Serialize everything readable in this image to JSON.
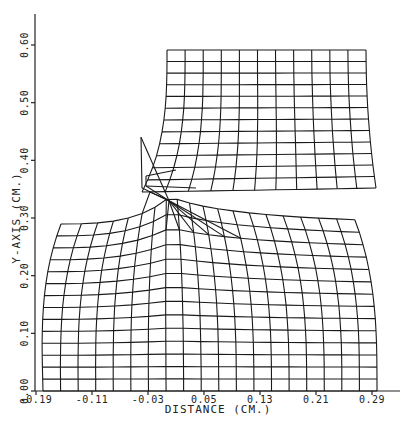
{
  "chart_data": {
    "type": "mesh",
    "title": "",
    "xlabel": "DISTANCE (CM.)",
    "ylabel": "Y-AXIS (CM.)",
    "x_ticks": [
      "-0.19",
      "-0.11",
      "-0.03",
      "0.05",
      "0.13",
      "0.21",
      "0.29"
    ],
    "y_ticks": [
      "0.00",
      "0.10",
      "0.20",
      "0.30",
      "0.40",
      "0.50",
      "0.60"
    ],
    "xlim": [
      -0.19,
      0.29
    ],
    "ylim": [
      0.0,
      0.6
    ],
    "grid": false,
    "regions": [
      {
        "name": "upper-block",
        "x_range": [
          -0.02,
          0.27
        ],
        "y_range": [
          0.33,
          0.59
        ],
        "cols": 11,
        "rows": 12
      },
      {
        "name": "lower-block",
        "x_range": [
          -0.18,
          0.29
        ],
        "y_range": [
          0.0,
          0.29
        ],
        "cols": 19,
        "rows": 14
      }
    ],
    "crack_tip": {
      "x": 0.0,
      "y": 0.33
    },
    "notch_flap_tip": {
      "x": -0.04,
      "y": 0.44
    }
  },
  "axes": {
    "x_axis_title": "DISTANCE (CM.)",
    "y_axis_title": "Y-AXIS (CM.)"
  },
  "colors": {
    "line": "#1a1a1a",
    "background": "#ffffff"
  }
}
